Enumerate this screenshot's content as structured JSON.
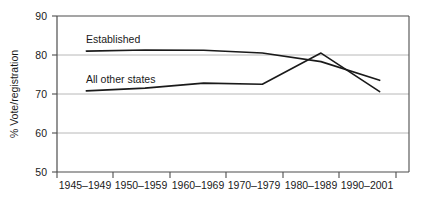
{
  "chart_data": {
    "type": "line",
    "title": "",
    "subtitle": "",
    "xlabel": "",
    "ylabel": "% Vote/registration",
    "categories": [
      "1945–1949",
      "1950–1959",
      "1960–1969",
      "1970–1979",
      "1980–1989",
      "1990–2001"
    ],
    "ylim": [
      50,
      90
    ],
    "yticks": [
      50,
      60,
      70,
      80,
      90
    ],
    "ytick_labels": [
      "50",
      "60",
      "70",
      "80",
      "90"
    ],
    "grid": "horizontal",
    "legend_position": "inline-annotations",
    "series": [
      {
        "name": "Established",
        "label_text": "Established",
        "values": [
          81.0,
          81.3,
          81.2,
          80.5,
          78.3,
          73.5
        ],
        "color": "#1a1a1a"
      },
      {
        "name": "All other states",
        "label_text": "All other states",
        "values": [
          70.8,
          71.5,
          72.8,
          72.5,
          80.5,
          70.6
        ],
        "color": "#1a1a1a"
      }
    ],
    "annotations": [
      {
        "text": "Established",
        "near_series": "Established"
      },
      {
        "text": "All other states",
        "near_series": "All other states"
      }
    ]
  },
  "axis": {
    "y_title": "% Vote/registration",
    "y_labels": [
      "90",
      "80",
      "70",
      "60",
      "50"
    ],
    "x_labels": [
      "1945–1949",
      "1950–1959",
      "1960–1969",
      "1970–1979",
      "1980–1989",
      "1990–2001"
    ]
  },
  "colors": {
    "background": "#ffffff",
    "line": "#1a1a1a",
    "gridline": "#b8b8b8",
    "axis": "#4d4d4d",
    "text": "#1a1a1a"
  }
}
